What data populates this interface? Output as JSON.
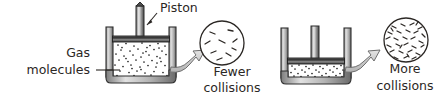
{
  "figure": {
    "background_color": "#ffffff",
    "ink_color": "#2b2724",
    "metal_light": "#d8d8d8",
    "metal_mid": "#9a9a9a",
    "metal_dark": "#3a3a3a",
    "arrow_fill": "#c9c9c9",
    "arrow_stroke": "#6e6e6e"
  },
  "labels": {
    "piston": "Piston",
    "gas_molecules_line1": "Gas",
    "gas_molecules_line2": "molecules",
    "fewer_line1": "Fewer",
    "fewer_line2": "collisions",
    "more_line1": "More",
    "more_line2": "collisions"
  },
  "panels": [
    {
      "id": "expanded",
      "name": "large-volume-cylinder",
      "piston_position": "raised",
      "gas_volume": "large",
      "molecule_count": 74,
      "inset": {
        "name": "fewer-collisions-inset",
        "molecule_count": 9,
        "density": "sparse",
        "caption_line1": "Fewer",
        "caption_line2": "collisions"
      }
    },
    {
      "id": "compressed",
      "name": "small-volume-cylinder",
      "piston_position": "lowered",
      "gas_volume": "small",
      "molecule_count": 72,
      "inset": {
        "name": "more-collisions-inset",
        "molecule_count": 42,
        "density": "dense",
        "caption_line1": "More",
        "caption_line2": "collisions"
      }
    }
  ]
}
